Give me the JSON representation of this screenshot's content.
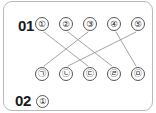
{
  "card": {
    "border_color": "#b9b9b9",
    "background": "#ffffff"
  },
  "questions": [
    {
      "id": "q1",
      "number": "01"
    },
    {
      "id": "q2",
      "number": "02",
      "answer_choice": "①"
    }
  ],
  "matching": {
    "top_row": [
      {
        "label": "①",
        "x": 38,
        "y": 22
      },
      {
        "label": "②",
        "x": 62,
        "y": 22
      },
      {
        "label": "③",
        "x": 86,
        "y": 22
      },
      {
        "label": "④",
        "x": 110,
        "y": 22
      },
      {
        "label": "⑤",
        "x": 134,
        "y": 22
      }
    ],
    "bottom_row": [
      {
        "label": "㉠",
        "x": 38,
        "y": 72
      },
      {
        "label": "㉡",
        "x": 62,
        "y": 72
      },
      {
        "label": "㉢",
        "x": 86,
        "y": 72
      },
      {
        "label": "㉣",
        "x": 110,
        "y": 72
      },
      {
        "label": "㉤",
        "x": 134,
        "y": 72
      }
    ],
    "connections": [
      {
        "from": "①",
        "to": "㉢",
        "x1": 40,
        "y1": 30,
        "x2": 84,
        "y2": 64
      },
      {
        "from": "②",
        "to": "㉣",
        "x1": 64,
        "y1": 30,
        "x2": 108,
        "y2": 64
      },
      {
        "from": "③",
        "to": "㉠",
        "x1": 84,
        "y1": 30,
        "x2": 40,
        "y2": 64
      },
      {
        "from": "④",
        "to": "㉤",
        "x1": 112,
        "y1": 30,
        "x2": 132,
        "y2": 64
      },
      {
        "from": "⑤",
        "to": "㉡",
        "x1": 132,
        "y1": 30,
        "x2": 64,
        "y2": 64
      }
    ],
    "line_color": "#9a9a9a"
  }
}
